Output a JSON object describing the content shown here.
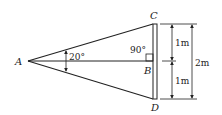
{
  "diagram": {
    "points": {
      "A": "A",
      "B": "B",
      "C": "C",
      "D": "D"
    },
    "angles": {
      "apex": "20°",
      "right": "90°"
    },
    "dimensions": {
      "upper": "1m",
      "lower": "1m",
      "total": "2m"
    },
    "colors": {
      "line": "#222222",
      "background": "#ffffff"
    }
  }
}
